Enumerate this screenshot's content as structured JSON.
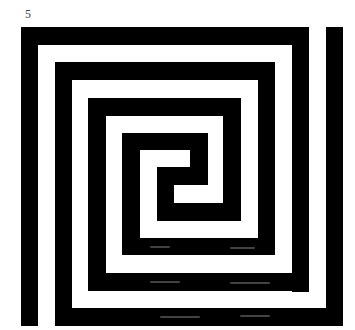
{
  "figure": {
    "label": "5",
    "stroke_color": "#000000",
    "background_color": "#ffffff",
    "segments": [
      {
        "x": 21,
        "y": 27,
        "w": 288,
        "h": 18
      },
      {
        "x": 21,
        "y": 27,
        "w": 17,
        "h": 299
      },
      {
        "x": 292,
        "y": 27,
        "w": 17,
        "h": 265
      },
      {
        "x": 88,
        "y": 273,
        "w": 221,
        "h": 18
      },
      {
        "x": 88,
        "y": 98,
        "w": 18,
        "h": 193
      },
      {
        "x": 326,
        "y": 27,
        "w": 17,
        "h": 299
      },
      {
        "x": 55,
        "y": 308,
        "w": 288,
        "h": 18
      },
      {
        "x": 55,
        "y": 62,
        "w": 17,
        "h": 264
      },
      {
        "x": 55,
        "y": 62,
        "w": 220,
        "h": 18
      },
      {
        "x": 258,
        "y": 62,
        "w": 17,
        "h": 193
      },
      {
        "x": 122,
        "y": 238,
        "w": 153,
        "h": 17
      },
      {
        "x": 122,
        "y": 133,
        "w": 18,
        "h": 122
      },
      {
        "x": 122,
        "y": 133,
        "w": 86,
        "h": 17
      },
      {
        "x": 190,
        "y": 133,
        "w": 18,
        "h": 52
      },
      {
        "x": 157,
        "y": 167,
        "w": 51,
        "h": 18
      },
      {
        "x": 88,
        "y": 98,
        "w": 153,
        "h": 18
      },
      {
        "x": 223,
        "y": 98,
        "w": 18,
        "h": 123
      },
      {
        "x": 157,
        "y": 203,
        "w": 84,
        "h": 18
      },
      {
        "x": 157,
        "y": 167,
        "w": 17,
        "h": 54
      }
    ],
    "noise": [
      {
        "x": 150,
        "y": 281,
        "w": 30
      },
      {
        "x": 230,
        "y": 282,
        "w": 40
      },
      {
        "x": 160,
        "y": 316,
        "w": 40
      },
      {
        "x": 240,
        "y": 315,
        "w": 30
      },
      {
        "x": 230,
        "y": 247,
        "w": 25
      },
      {
        "x": 150,
        "y": 246,
        "w": 20
      }
    ]
  }
}
